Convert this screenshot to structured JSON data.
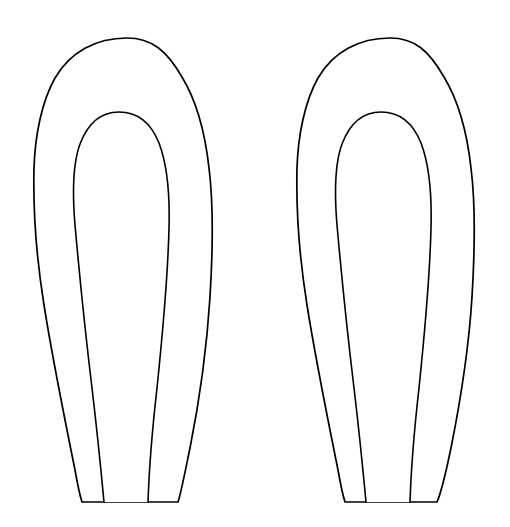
{
  "document": {
    "title": "Shape Outlines",
    "background_color": "#ffffff",
    "width": 510,
    "height": 527,
    "description": "Two identical side-by-side tall rounded-dome (leaf/shoe-sole) outlines, each drawn as a black contour with a concentric inner contour and a flat horizontal base."
  },
  "style": {
    "stroke_color": "#000000",
    "fill_color": "#ffffff",
    "stroke_width": 1.7,
    "inner_stroke_width": 1.6
  },
  "shapes": [
    {
      "name": "left-shape",
      "outer": {
        "apex_x": 127,
        "apex_y": 38,
        "left_extreme_x": 34,
        "left_extreme_y": 170,
        "right_extreme_x": 211,
        "right_extreme_y": 165,
        "base_left_x": 82,
        "base_right_x": 178,
        "base_y": 502,
        "path": "M 127 38 C 96 38 70 52 55 78 C 42 101 35 135 34 168 C 33 210 36 255 44 305 C 53 362 66 425 75 470 C 78 487 80 496 82 502 L 178 502 C 181 493 185 472 190 448 C 200 398 207 345 210 297 C 213 248 213 200 209 168 C 205 132 196 100 182 77 C 167 51 152 38 127 38 Z"
      },
      "inner": {
        "apex_x": 118,
        "apex_y": 112,
        "left_extreme_x": 71,
        "left_extreme_y": 185,
        "right_extreme_x": 171,
        "right_extreme_y": 180,
        "base_left_x": 104,
        "base_right_x": 148,
        "base_y": 502,
        "path": "M 104 502 C 101 470 97 430 92 388 C 85 330 79 270 75 225 C 72 189 73 163 80 144 C 88 123 101 112 119 112 C 137 112 151 123 159 143 C 167 164 170 192 169 228 C 168 272 163 330 157 388 C 152 432 149 472 148 502"
      }
    },
    {
      "name": "right-shape",
      "outer": {
        "apex_x": 390,
        "apex_y": 38,
        "left_extreme_x": 297,
        "left_extreme_y": 170,
        "right_extreme_x": 473,
        "right_extreme_y": 165,
        "base_left_x": 345,
        "base_right_x": 437,
        "base_y": 502,
        "path": "M 390 38 C 359 38 333 52 318 78 C 305 101 298 135 297 168 C 296 210 299 255 307 305 C 316 362 329 425 338 470 C 341 487 343 496 345 502 L 437 502 C 441 493 446 472 451 448 C 461 398 469 345 472 297 C 475 248 475 200 471 168 C 467 132 458 100 444 77 C 429 51 415 38 390 38 Z"
      },
      "inner": {
        "apex_x": 382,
        "apex_y": 112,
        "left_extreme_x": 334,
        "left_extreme_y": 185,
        "right_extreme_x": 434,
        "right_extreme_y": 180,
        "base_left_x": 366,
        "base_right_x": 410,
        "base_y": 502,
        "path": "M 366 502 C 363 470 359 430 354 388 C 347 330 341 270 337 225 C 334 189 335 163 342 144 C 350 123 363 112 381 112 C 399 112 413 123 421 143 C 429 164 432 192 431 228 C 430 272 425 330 419 388 C 414 432 411 472 410 502"
      }
    }
  ]
}
